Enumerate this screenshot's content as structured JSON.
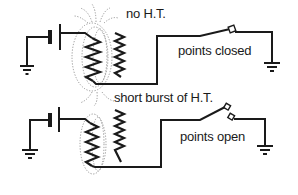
{
  "diagram": {
    "panels": [
      {
        "id": "top",
        "state": "closed",
        "coil_label": "no H.T.",
        "switch_label": "points closed"
      },
      {
        "id": "bottom",
        "state": "open",
        "coil_label": "short burst of H.T.",
        "switch_label": "points open"
      }
    ],
    "components": [
      "battery",
      "primary-coil",
      "secondary-coil",
      "contact-breaker-points",
      "ground"
    ],
    "colors": {
      "ink": "#1a1a1a",
      "field_lines": "#8a8a8a",
      "background": "#ffffff"
    }
  }
}
